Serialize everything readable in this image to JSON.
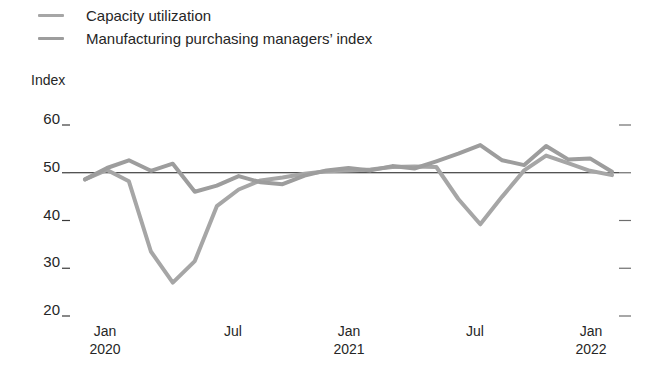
{
  "legend": {
    "position": "top-left",
    "items": [
      {
        "label": "Capacity utilization",
        "color": "#a6a6a6",
        "key": "capacity_utilization"
      },
      {
        "label": "Manufacturing purchasing managers’ index",
        "color": "#9d9d9d",
        "key": "pmi"
      }
    ]
  },
  "axes": {
    "y_title": "Index",
    "y_ticks": [
      "60",
      "50",
      "40",
      "30",
      "20"
    ],
    "x_ticks": [
      {
        "month": "Jan",
        "year": "2020"
      },
      {
        "month": "Jul",
        "year": ""
      },
      {
        "month": "Jan",
        "year": "2021"
      },
      {
        "month": "Jul",
        "year": ""
      },
      {
        "month": "Jan",
        "year": "2022"
      }
    ]
  },
  "chart_data": {
    "type": "line",
    "title": "",
    "subtitle": "",
    "xlabel": "",
    "ylabel": "Index",
    "ylim": [
      20,
      62
    ],
    "yticks": [
      20,
      30,
      40,
      50,
      60
    ],
    "grid": false,
    "reference_line": {
      "value": 50,
      "color": "#1a1a1a",
      "width": 1
    },
    "legend_position": "top-left",
    "x": [
      "2020-01",
      "2020-02",
      "2020-03",
      "2020-04",
      "2020-05",
      "2020-06",
      "2020-07",
      "2020-08",
      "2020-09",
      "2020-10",
      "2020-11",
      "2020-12",
      "2021-01",
      "2021-02",
      "2021-03",
      "2021-04",
      "2021-05",
      "2021-06",
      "2021-07",
      "2021-08",
      "2021-09",
      "2021-10",
      "2021-11",
      "2021-12",
      "2022-01"
    ],
    "x_tick_labels": [
      "Jan 2020",
      "Jul",
      "Jan 2021",
      "Jul",
      "Jan 2022"
    ],
    "series": [
      {
        "name": "Capacity utilization",
        "color": "#a6a6a6",
        "values": [
          48.6,
          50.6,
          48.2,
          33.5,
          27.0,
          31.5,
          43.0,
          46.5,
          48.4,
          49.0,
          49.8,
          50.3,
          50.5,
          50.7,
          51.2,
          51.3,
          51.2,
          44.5,
          39.2,
          45.0,
          50.5,
          53.6,
          52.0,
          50.4,
          49.5
        ]
      },
      {
        "name": "Manufacturing purchasing managers’ index",
        "color": "#9d9d9d",
        "values": [
          48.6,
          51.0,
          52.6,
          50.4,
          51.9,
          46.0,
          47.3,
          49.3,
          48.0,
          47.6,
          49.4,
          50.5,
          51.0,
          50.5,
          51.4,
          50.9,
          52.4,
          54.0,
          55.8,
          52.6,
          51.6,
          55.6,
          52.8,
          53.0,
          50.2
        ]
      }
    ]
  }
}
